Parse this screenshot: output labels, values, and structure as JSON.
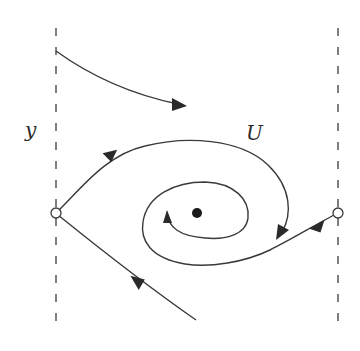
{
  "diagram": {
    "type": "phase-portrait",
    "labels": {
      "y_label": "y",
      "orbit_label": "U"
    },
    "elements": {
      "left_boundary": "dashed vertical line",
      "right_boundary": "dashed vertical line",
      "left_equilibrium": "open circle (saddle/unstable point)",
      "right_equilibrium": "open circle",
      "center_point": "filled dot (stable focus)"
    },
    "colors": {
      "stroke": "#3a3a3a",
      "background": "#ffffff"
    }
  }
}
